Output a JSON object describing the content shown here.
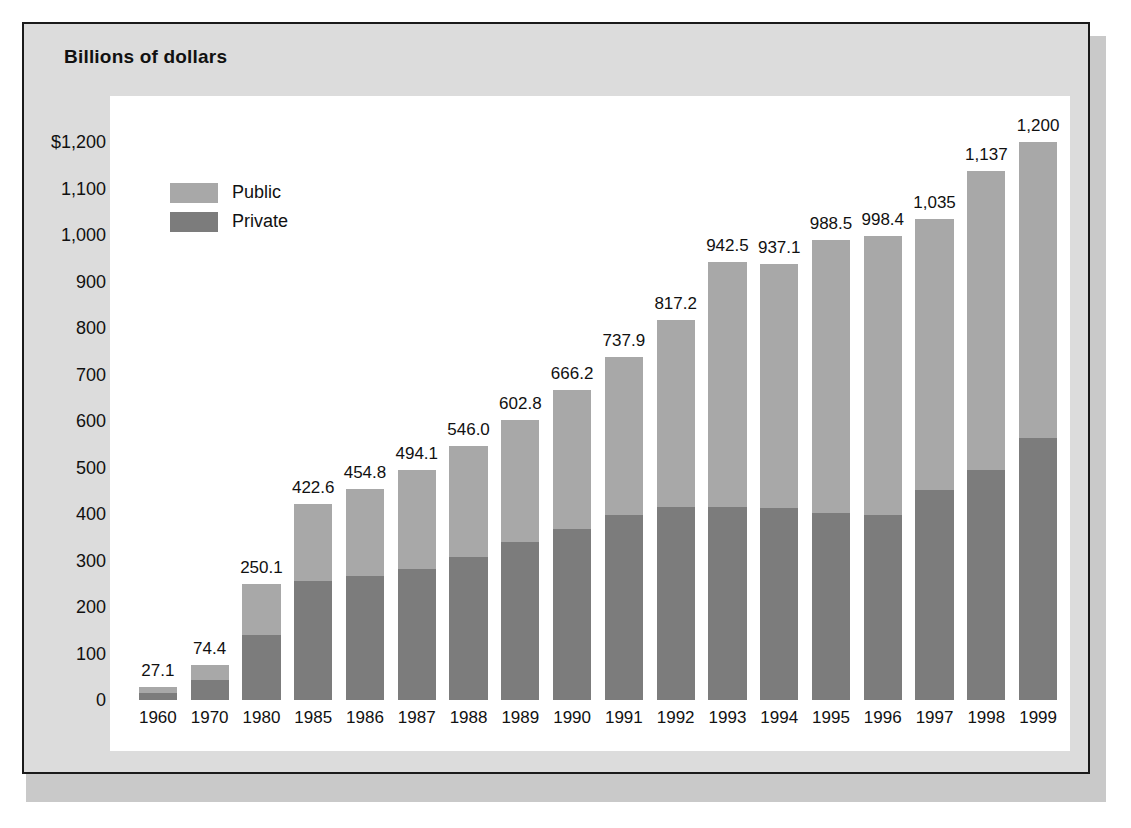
{
  "panel": {
    "title": "Billions of dollars"
  },
  "legend": {
    "items": [
      {
        "label": "Public",
        "color": "#a8a8a8"
      },
      {
        "label": "Private",
        "color": "#7c7c7c"
      }
    ]
  },
  "colors": {
    "public": "#a8a8a8",
    "private": "#7c7c7c",
    "panel_bg": "#dcdcdc",
    "plot_bg": "#ffffff",
    "border": "#1a1a1a",
    "text": "#111111"
  },
  "chart_data": {
    "type": "bar",
    "stacked": true,
    "title": "Billions of dollars",
    "xlabel": "",
    "ylabel": "Billions of dollars",
    "ylim": [
      0,
      1200
    ],
    "ytick_labels": [
      "$1,200",
      "1,100",
      "1,000",
      "900",
      "800",
      "700",
      "600",
      "500",
      "400",
      "300",
      "200",
      "100",
      "0"
    ],
    "yticks": [
      1200,
      1100,
      1000,
      900,
      800,
      700,
      600,
      500,
      400,
      300,
      200,
      100,
      0
    ],
    "grid": false,
    "legend_position": "upper-left-inside",
    "categories": [
      "1960",
      "1970",
      "1980",
      "1985",
      "1986",
      "1987",
      "1988",
      "1989",
      "1990",
      "1991",
      "1992",
      "1993",
      "1994",
      "1995",
      "1996",
      "1997",
      "1998",
      "1999"
    ],
    "series": [
      {
        "name": "Private",
        "values": [
          16.0,
          42.0,
          140.0,
          256.0,
          266.0,
          282.0,
          307.0,
          340.0,
          368.0,
          397.0,
          415.0,
          415.0,
          414.0,
          403.0,
          397.0,
          452.0,
          495.0,
          563.0
        ]
      },
      {
        "name": "Public",
        "values": [
          11.1,
          32.4,
          110.1,
          166.6,
          188.8,
          212.1,
          239.0,
          262.8,
          298.2,
          340.9,
          402.2,
          527.5,
          523.1,
          585.5,
          601.4,
          583.0,
          642.0,
          637.0
        ]
      }
    ],
    "totals": [
      27.1,
      74.4,
      250.1,
      422.6,
      454.8,
      494.1,
      546.0,
      602.8,
      666.2,
      737.9,
      817.2,
      942.5,
      937.1,
      988.5,
      998.4,
      1035,
      1137,
      1200
    ],
    "total_labels": [
      "27.1",
      "74.4",
      "250.1",
      "422.6",
      "454.8",
      "494.1",
      "546.0",
      "602.8",
      "666.2",
      "737.9",
      "817.2",
      "942.5",
      "937.1",
      "988.5",
      "998.4",
      "1,035",
      "1,137",
      "1,200"
    ]
  }
}
